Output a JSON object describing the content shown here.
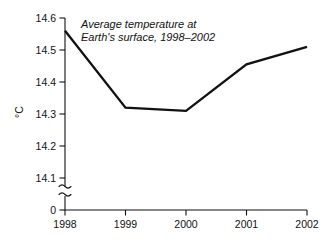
{
  "chart_data": {
    "type": "line",
    "title": "Average temperature at Earth's surface, 1998–2002",
    "title_line1": "Average temperature at",
    "title_line2": "Earth's surface, 1998–2002",
    "xlabel": "",
    "ylabel": "°C",
    "categories": [
      "1998",
      "1999",
      "2000",
      "2001",
      "2002"
    ],
    "x": [
      1998,
      1999,
      2000,
      2001,
      2002
    ],
    "values": [
      14.56,
      14.32,
      14.31,
      14.455,
      14.51
    ],
    "series": [
      {
        "name": "Average temperature at Earth's surface",
        "values": [
          14.56,
          14.32,
          14.31,
          14.455,
          14.51
        ]
      }
    ],
    "ylim": [
      14.05,
      14.6
    ],
    "ytick_labels": [
      "14.6",
      "14.5",
      "14.4",
      "14.3",
      "14.2",
      "14.1"
    ],
    "ytick_values": [
      14.6,
      14.5,
      14.4,
      14.3,
      14.2,
      14.1
    ],
    "zero_tick_label": "0",
    "axis_break": true,
    "axis_break_note": "y-axis broken between 14.1 and 0",
    "grid": false,
    "legend": "none",
    "line_color": "#111111",
    "background_color": "#ffffff"
  },
  "axes": {
    "x_ticks": [
      {
        "label": "1998",
        "px": 65
      },
      {
        "label": "1999",
        "px": 125.5
      },
      {
        "label": "2000",
        "px": 186
      },
      {
        "label": "2001",
        "px": 246.5
      },
      {
        "label": "2002",
        "px": 307
      }
    ],
    "y_ticks": [
      {
        "label": "14.6",
        "px": 18
      },
      {
        "label": "14.5",
        "px": 50
      },
      {
        "label": "14.4",
        "px": 82
      },
      {
        "label": "14.3",
        "px": 114
      },
      {
        "label": "14.2",
        "px": 146
      },
      {
        "label": "14.1",
        "px": 178
      },
      {
        "label": "0",
        "px": 210
      }
    ]
  },
  "points_px": [
    {
      "x": 65,
      "y": 31
    },
    {
      "x": 125.5,
      "y": 100
    },
    {
      "x": 186,
      "y": 102.5
    },
    {
      "x": 246.5,
      "y": 61.5
    },
    {
      "x": 307,
      "y": 46
    }
  ]
}
